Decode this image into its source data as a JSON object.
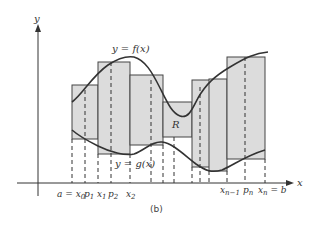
{
  "figure": {
    "caption": "(b)",
    "axes": {
      "x_label": "x",
      "y_label": "y"
    },
    "curves": {
      "upper_label": "y = f(x)",
      "lower_label": "y = g(x)"
    },
    "region_label": "R",
    "x_tick_labels": {
      "a_x0": "a = x",
      "x0_sub": "0",
      "p1": "p",
      "p1_sub": "1",
      "x1": "x",
      "x1_sub": "1",
      "p2": "p",
      "p2_sub": "2",
      "x2": "x",
      "x2_sub": "2",
      "xn1": "x",
      "xn1_sub": "n−1",
      "pn": "p",
      "pn_sub": "n",
      "xn_b": "x",
      "xn_sub": "n",
      "xn_eq_b": " = b"
    },
    "colors": {
      "fill": "#dcdcdc",
      "stroke": "#333333",
      "background": "#ffffff"
    }
  }
}
